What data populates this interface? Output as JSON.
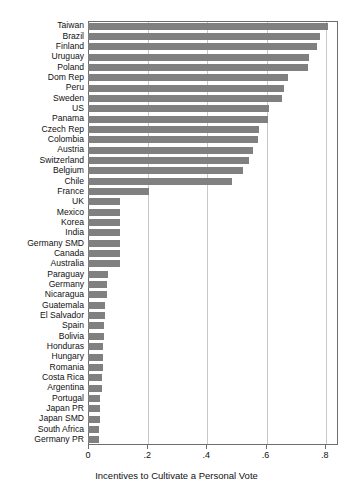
{
  "chart_data": {
    "type": "bar",
    "orientation": "horizontal",
    "title": "",
    "subtitle": "",
    "xlabel": "Incentives to Cultivate a Personal Vote",
    "ylabel": "",
    "xlim": [
      0,
      0.845
    ],
    "ylim": null,
    "grid": "vertical-only",
    "legend": null,
    "legend_position": "none",
    "xticks": [
      "0",
      ".2",
      ".4",
      ".6",
      ".8"
    ],
    "xtickvalues": [
      0,
      0.2,
      0.4,
      0.6,
      0.8
    ],
    "bar_color": "#808080",
    "frame_color": "#6d6d6d",
    "gridline_color": "#c9c9c9",
    "categories": [
      "Taiwan",
      "Brazil",
      "Finland",
      "Uruguay",
      "Poland",
      "Dom Rep",
      "Peru",
      "Sweden",
      "US",
      "Panama",
      "Czech Rep",
      "Colombia",
      "Austria",
      "Switzerland",
      "Belgium",
      "Chile",
      "France",
      "UK",
      "Mexico",
      "Korea",
      "India",
      "Germany SMD",
      "Canada",
      "Australia",
      "Paraguay",
      "Germany",
      "Nicaragua",
      "Guatemala",
      "El Salvador",
      "Spain",
      "Bolivia",
      "Honduras",
      "Hungary",
      "Romania",
      "Costa Rica",
      "Argentina",
      "Portugal",
      "Japan PR",
      "Japan  SMD",
      "South Africa",
      "Germany PR"
    ],
    "values": [
      0.81,
      0.784,
      0.775,
      0.748,
      0.744,
      0.675,
      0.664,
      0.657,
      0.613,
      0.609,
      0.578,
      0.575,
      0.559,
      0.543,
      0.525,
      0.487,
      0.205,
      0.107,
      0.107,
      0.107,
      0.107,
      0.107,
      0.107,
      0.107,
      0.068,
      0.064,
      0.063,
      0.059,
      0.056,
      0.055,
      0.054,
      0.052,
      0.05,
      0.05,
      0.048,
      0.047,
      0.042,
      0.039,
      0.039,
      0.038,
      0.037
    ]
  }
}
